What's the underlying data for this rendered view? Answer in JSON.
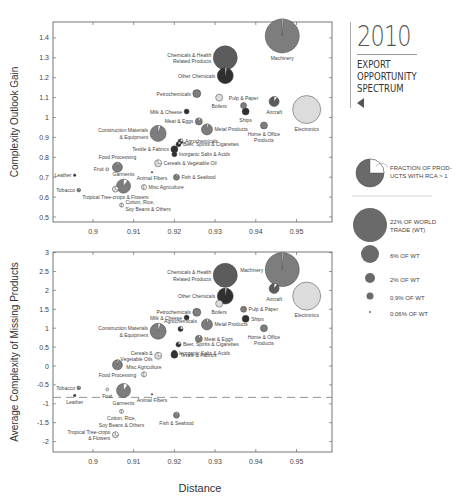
{
  "title": {
    "year": "2010",
    "line1": "EXPORT",
    "line2": "OPPORTUNITY",
    "line3": "SPECTRUM"
  },
  "legend": {
    "pie_label_1": "FRACTION OF PROD-",
    "pie_label_2": "UCTS WITH RCA > 1",
    "sizes": [
      {
        "label_1": "22% OF WORLD",
        "label_2": "TRADE (WT)",
        "r": 17
      },
      {
        "label_1": "6% OF WT",
        "label_2": "",
        "r": 9
      },
      {
        "label_1": "2% OF WT",
        "label_2": "",
        "r": 5
      },
      {
        "label_1": "0.9% OF WT",
        "label_2": "",
        "r": 3.5
      },
      {
        "label_1": "0.06% OF WT",
        "label_2": "",
        "r": 1
      }
    ]
  },
  "colors": {
    "mid_gray": "#7a7a7a",
    "dark_gray": "#333333",
    "light_gray": "#d8d8d8",
    "axis": "#555555"
  },
  "chart_data": [
    {
      "type": "scatter",
      "title": "",
      "xlabel": "",
      "ylabel": "Complexity Outlook Gain",
      "xlim": [
        0.88,
        0.959
      ],
      "ylim": [
        0.48,
        1.5
      ],
      "xticks": [
        "0.9",
        "0.91",
        "0.92",
        "0.93",
        "0.94",
        "0.95"
      ],
      "yticks": [
        "0.5",
        "0.6",
        "0.7",
        "0.8",
        "0.9",
        "1",
        "1.1",
        "1.2",
        "1.3",
        "1.4"
      ],
      "grid": false,
      "points": [
        {
          "label": "Machinery",
          "x": 0.9465,
          "y": 1.41,
          "size": 17,
          "shade": "mid",
          "rca": 0.01
        },
        {
          "label": "Chemicals & Health Related Products",
          "x": 0.9325,
          "y": 1.3,
          "size": 12,
          "shade": "dark",
          "rca": 0.0
        },
        {
          "label": "Other Chemicals",
          "x": 0.9325,
          "y": 1.21,
          "size": 8,
          "shade": "darker",
          "rca": 0.03
        },
        {
          "label": "Electronics",
          "x": 0.9525,
          "y": 1.04,
          "size": 14,
          "shade": "light",
          "rca": 0.0
        },
        {
          "label": "Aircraft",
          "x": 0.9445,
          "y": 1.08,
          "size": 5,
          "shade": "dark",
          "rca": 0.1
        },
        {
          "label": "Petrochemicals",
          "x": 0.9255,
          "y": 1.12,
          "size": 4,
          "shade": "mid",
          "rca": 0.0
        },
        {
          "label": "Boilers",
          "x": 0.931,
          "y": 1.1,
          "size": 3.5,
          "shade": "light",
          "rca": 0.0
        },
        {
          "label": "Pulp & Paper",
          "x": 0.937,
          "y": 1.06,
          "size": 3,
          "shade": "mid",
          "rca": 0.0
        },
        {
          "label": "Ships",
          "x": 0.9375,
          "y": 1.03,
          "size": 3.5,
          "shade": "darker",
          "rca": 0.0
        },
        {
          "label": "Home & Office Products",
          "x": 0.942,
          "y": 0.96,
          "size": 3.5,
          "shade": "mid",
          "rca": 0.0
        },
        {
          "label": "Milk & Cheese",
          "x": 0.923,
          "y": 1.03,
          "size": 2.5,
          "shade": "darker",
          "rca": 0.0
        },
        {
          "label": "Meat & Eggs",
          "x": 0.926,
          "y": 0.98,
          "size": 3.5,
          "shade": "mid",
          "rca": 0.1
        },
        {
          "label": "Metal Products",
          "x": 0.928,
          "y": 0.94,
          "size": 5.5,
          "shade": "mid",
          "rca": 0.05
        },
        {
          "label": "Construction Materials & Equipment",
          "x": 0.916,
          "y": 0.92,
          "size": 8,
          "shade": "mid",
          "rca": 0.05
        },
        {
          "label": "Agrochemicals",
          "x": 0.9215,
          "y": 0.88,
          "size": 2.5,
          "shade": "darker",
          "rca": 0.25
        },
        {
          "label": "Beer, Spirits & Cigarettes",
          "x": 0.921,
          "y": 0.865,
          "size": 2.5,
          "shade": "darker",
          "rca": 0.2
        },
        {
          "label": "Textile & Fabrics",
          "x": 0.92,
          "y": 0.84,
          "size": 3.5,
          "shade": "darker",
          "rca": 0.0
        },
        {
          "label": "Inorganic Salts & Acids",
          "x": 0.92,
          "y": 0.815,
          "size": 2.5,
          "shade": "darker",
          "rca": 0.0
        },
        {
          "label": "Cereals & Vegetable Oil",
          "x": 0.916,
          "y": 0.77,
          "size": 3.5,
          "shade": "light",
          "rca": 0.25
        },
        {
          "label": "Food Processing",
          "x": 0.906,
          "y": 0.75,
          "size": 5,
          "shade": "mid",
          "rca": 0.05
        },
        {
          "label": "Fruit",
          "x": 0.9035,
          "y": 0.74,
          "size": 1.5,
          "shade": "light",
          "rca": 0.5
        },
        {
          "label": "Animal Fibers",
          "x": 0.9145,
          "y": 0.725,
          "size": 0.8,
          "shade": "darker",
          "rca": 0.0
        },
        {
          "label": "Fish & Seafood",
          "x": 0.9205,
          "y": 0.7,
          "size": 3,
          "shade": "mid",
          "rca": 0.1
        },
        {
          "label": "Leather",
          "x": 0.8955,
          "y": 0.71,
          "size": 1.2,
          "shade": "darker",
          "rca": 0.0
        },
        {
          "label": "Garments",
          "x": 0.9075,
          "y": 0.655,
          "size": 7,
          "shade": "mid",
          "rca": 0.1
        },
        {
          "label": "Tropical Tree-crops & Flowers",
          "x": 0.9055,
          "y": 0.64,
          "size": 3,
          "shade": "light",
          "rca": 0.3
        },
        {
          "label": "Misc Agriculture",
          "x": 0.9125,
          "y": 0.65,
          "size": 2.5,
          "shade": "light",
          "rca": 0.5
        },
        {
          "label": "Tobacco",
          "x": 0.8965,
          "y": 0.635,
          "size": 1.8,
          "shade": "mid",
          "rca": 0.2
        },
        {
          "label": "Cotton, Rice, Soy Beans & Others",
          "x": 0.907,
          "y": 0.56,
          "size": 2,
          "shade": "light",
          "rca": 0.5
        }
      ]
    },
    {
      "type": "scatter",
      "title": "",
      "xlabel": "Distance",
      "ylabel": "Average Complexity of Missing Products",
      "xlim": [
        0.88,
        0.959
      ],
      "ylim": [
        -2.3,
        3.0
      ],
      "xticks": [
        "0.9",
        "0.91",
        "0.92",
        "0.93",
        "0.94",
        "0.95"
      ],
      "yticks": [
        "-2",
        "-1.5",
        "-1",
        "-0.5",
        "0",
        "0.5",
        "1",
        "1.5",
        "2",
        "2.5",
        "3"
      ],
      "grid": false,
      "reference_line": {
        "y": -0.83,
        "style": "dashed"
      },
      "points": [
        {
          "label": "Machinery",
          "x": 0.9465,
          "y": 2.55,
          "size": 17,
          "shade": "mid",
          "rca": 0.01
        },
        {
          "label": "Chemicals & Health Related Products",
          "x": 0.9325,
          "y": 2.4,
          "size": 12,
          "shade": "dark",
          "rca": 0.0
        },
        {
          "label": "Aircraft",
          "x": 0.9445,
          "y": 2.05,
          "size": 5,
          "shade": "dark",
          "rca": 0.1
        },
        {
          "label": "Electronics",
          "x": 0.9525,
          "y": 1.85,
          "size": 14,
          "shade": "light",
          "rca": 0.0
        },
        {
          "label": "Other Chemicals",
          "x": 0.9325,
          "y": 1.85,
          "size": 8,
          "shade": "darker",
          "rca": 0.03
        },
        {
          "label": "Boilers",
          "x": 0.931,
          "y": 1.65,
          "size": 3.5,
          "shade": "light",
          "rca": 0.0
        },
        {
          "label": "Pulp & Paper",
          "x": 0.937,
          "y": 1.5,
          "size": 3,
          "shade": "mid",
          "rca": 0.0
        },
        {
          "label": "Petrochemicals",
          "x": 0.9255,
          "y": 1.42,
          "size": 4,
          "shade": "mid",
          "rca": 0.0
        },
        {
          "label": "Milk & Cheese",
          "x": 0.923,
          "y": 1.28,
          "size": 2.5,
          "shade": "darker",
          "rca": 0.0
        },
        {
          "label": "Ships",
          "x": 0.9375,
          "y": 1.25,
          "size": 3.5,
          "shade": "darker",
          "rca": 0.0
        },
        {
          "label": "Metal Products",
          "x": 0.928,
          "y": 1.1,
          "size": 5.5,
          "shade": "mid",
          "rca": 0.05
        },
        {
          "label": "Home & Office Products",
          "x": 0.942,
          "y": 1.0,
          "size": 3.5,
          "shade": "mid",
          "rca": 0.0
        },
        {
          "label": "Agrochemicals",
          "x": 0.9215,
          "y": 0.98,
          "size": 2.5,
          "shade": "darker",
          "rca": 0.25
        },
        {
          "label": "Construction Materials & Equipment",
          "x": 0.916,
          "y": 0.92,
          "size": 8,
          "shade": "mid",
          "rca": 0.05
        },
        {
          "label": "Meat & Eggs",
          "x": 0.926,
          "y": 0.72,
          "size": 3.5,
          "shade": "mid",
          "rca": 0.1
        },
        {
          "label": "Beer, Spirits & Cigarettes",
          "x": 0.921,
          "y": 0.57,
          "size": 2.5,
          "shade": "darker",
          "rca": 0.2
        },
        {
          "label": "Inorganic Salts & Acids",
          "x": 0.92,
          "y": 0.35,
          "size": 2.5,
          "shade": "darker",
          "rca": 0.0
        },
        {
          "label": "Textile & Fabrics",
          "x": 0.92,
          "y": 0.3,
          "size": 3.5,
          "shade": "darker",
          "rca": 0.0
        },
        {
          "label": "Cereals & Vegetable Oils",
          "x": 0.916,
          "y": 0.27,
          "size": 3.5,
          "shade": "light",
          "rca": 0.25
        },
        {
          "label": "Food Processing",
          "x": 0.906,
          "y": 0.03,
          "size": 5,
          "shade": "mid",
          "rca": 0.05
        },
        {
          "label": "Misc Agriculture",
          "x": 0.9125,
          "y": -0.22,
          "size": 2.5,
          "shade": "light",
          "rca": 0.5
        },
        {
          "label": "Tobacco",
          "x": 0.8965,
          "y": -0.58,
          "size": 1.8,
          "shade": "mid",
          "rca": 0.2
        },
        {
          "label": "Fruit",
          "x": 0.9035,
          "y": -0.62,
          "size": 1.5,
          "shade": "light",
          "rca": 0.5
        },
        {
          "label": "Garments",
          "x": 0.9075,
          "y": -0.65,
          "size": 7,
          "shade": "mid",
          "rca": 0.1
        },
        {
          "label": "Animal Fibers",
          "x": 0.9145,
          "y": -0.75,
          "size": 0.8,
          "shade": "darker",
          "rca": 0.0
        },
        {
          "label": "Leather",
          "x": 0.8955,
          "y": -0.78,
          "size": 1.2,
          "shade": "darker",
          "rca": 0.0
        },
        {
          "label": "Cotton, Rice, Soy Beans & Others",
          "x": 0.907,
          "y": -1.2,
          "size": 2,
          "shade": "light",
          "rca": 0.5
        },
        {
          "label": "Fish & Seafood",
          "x": 0.9205,
          "y": -1.3,
          "size": 3,
          "shade": "mid",
          "rca": 0.1
        },
        {
          "label": "Tropical Tree-crops & Flowers",
          "x": 0.9055,
          "y": -1.82,
          "size": 3,
          "shade": "light",
          "rca": 0.3
        }
      ]
    }
  ]
}
